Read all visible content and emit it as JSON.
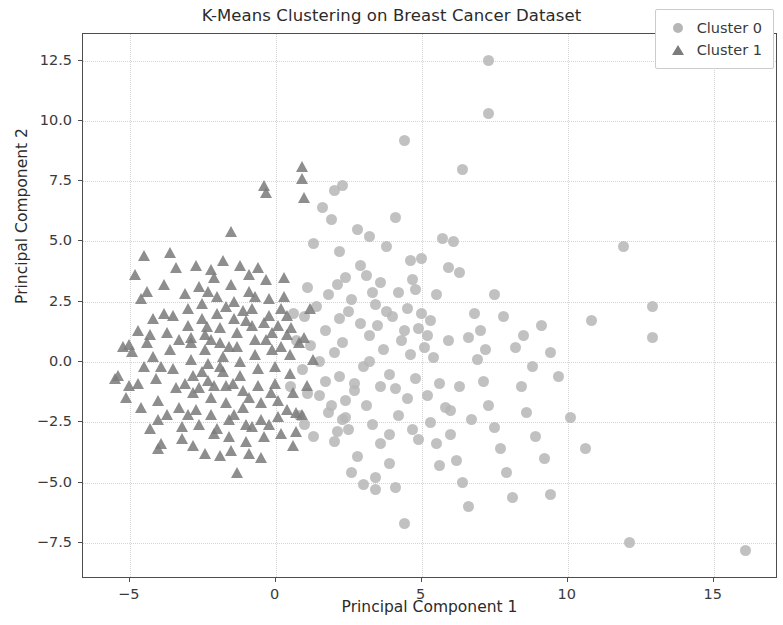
{
  "chart_data": {
    "type": "scatter",
    "title": "K-Means Clustering on Breast Cancer Dataset",
    "xlabel": "Principal Component 1",
    "ylabel": "Principal Component 2",
    "xlim": [
      -6.6,
      17.2
    ],
    "ylim": [
      -9.0,
      13.6
    ],
    "xticks": [
      -5,
      0,
      5,
      10,
      15
    ],
    "xticklabels": [
      "−5",
      "0",
      "5",
      "10",
      "15"
    ],
    "yticks": [
      -7.5,
      -5.0,
      -2.5,
      0.0,
      2.5,
      5.0,
      7.5,
      10.0,
      12.5
    ],
    "yticklabels": [
      "−7.5",
      "−5.0",
      "−2.5",
      "0.0",
      "2.5",
      "5.0",
      "7.5",
      "10.0",
      "12.5"
    ],
    "grid": true,
    "legend_position": "upper right",
    "series": [
      {
        "name": "Cluster 0",
        "marker": "circle",
        "color": "#b6b6b6",
        "points": [
          [
            1.3,
            4.9
          ],
          [
            1.6,
            6.4
          ],
          [
            1.9,
            5.9
          ],
          [
            2.2,
            4.6
          ],
          [
            2.4,
            3.5
          ],
          [
            2.5,
            2.1
          ],
          [
            1.4,
            2.3
          ],
          [
            1.7,
            1.3
          ],
          [
            2.0,
            0.4
          ],
          [
            2.2,
            -0.6
          ],
          [
            1.5,
            -1.4
          ],
          [
            1.8,
            -2.1
          ],
          [
            2.1,
            -2.9
          ],
          [
            2.4,
            -2.3
          ],
          [
            2.7,
            -1.2
          ],
          [
            3.0,
            -0.2
          ],
          [
            3.2,
            1.1
          ],
          [
            3.4,
            2.4
          ],
          [
            3.6,
            3.3
          ],
          [
            3.8,
            4.8
          ],
          [
            4.1,
            6.0
          ],
          [
            4.4,
            9.2
          ],
          [
            4.6,
            4.2
          ],
          [
            4.8,
            3.0
          ],
          [
            5.0,
            2.0
          ],
          [
            5.2,
            1.1
          ],
          [
            5.4,
            0.2
          ],
          [
            5.6,
            -0.9
          ],
          [
            5.8,
            -1.9
          ],
          [
            6.0,
            -3.0
          ],
          [
            6.2,
            -4.1
          ],
          [
            6.4,
            -5.0
          ],
          [
            6.6,
            -6.0
          ],
          [
            4.4,
            -6.7
          ],
          [
            4.1,
            -5.2
          ],
          [
            3.9,
            -4.2
          ],
          [
            3.6,
            -3.4
          ],
          [
            3.3,
            -2.6
          ],
          [
            3.1,
            -1.8
          ],
          [
            2.8,
            -3.9
          ],
          [
            2.6,
            -4.6
          ],
          [
            3.4,
            -4.8
          ],
          [
            3.9,
            -3.0
          ],
          [
            4.2,
            -2.2
          ],
          [
            4.5,
            -1.5
          ],
          [
            4.8,
            -0.7
          ],
          [
            5.1,
            0.6
          ],
          [
            5.3,
            1.7
          ],
          [
            5.5,
            2.8
          ],
          [
            5.9,
            3.9
          ],
          [
            6.1,
            5.0
          ],
          [
            6.4,
            8.0
          ],
          [
            7.3,
            12.5
          ],
          [
            7.3,
            10.3
          ],
          [
            6.6,
            1.0
          ],
          [
            6.9,
            0.1
          ],
          [
            7.1,
            -0.8
          ],
          [
            7.3,
            -1.8
          ],
          [
            7.5,
            -2.7
          ],
          [
            7.7,
            -3.6
          ],
          [
            7.9,
            -4.6
          ],
          [
            8.1,
            -5.6
          ],
          [
            7.5,
            2.8
          ],
          [
            7.8,
            1.9
          ],
          [
            8.2,
            0.6
          ],
          [
            8.4,
            -1.0
          ],
          [
            8.6,
            -2.1
          ],
          [
            8.9,
            -3.1
          ],
          [
            9.2,
            -4.0
          ],
          [
            9.4,
            -5.5
          ],
          [
            9.1,
            1.5
          ],
          [
            9.4,
            0.4
          ],
          [
            9.7,
            -0.6
          ],
          [
            10.1,
            -2.3
          ],
          [
            10.6,
            -3.6
          ],
          [
            10.8,
            1.7
          ],
          [
            11.9,
            4.8
          ],
          [
            12.1,
            -7.5
          ],
          [
            12.9,
            2.3
          ],
          [
            12.9,
            1.0
          ],
          [
            16.1,
            -7.8
          ],
          [
            1.1,
            3.1
          ],
          [
            1.0,
            1.9
          ],
          [
            1.2,
            0.7
          ],
          [
            0.9,
            -0.3
          ],
          [
            1.1,
            -1.3
          ],
          [
            0.8,
            -2.2
          ],
          [
            1.3,
            -3.1
          ],
          [
            2.0,
            7.1
          ],
          [
            2.3,
            7.3
          ],
          [
            2.9,
            4.0
          ],
          [
            3.1,
            3.6
          ],
          [
            3.3,
            2.9
          ],
          [
            3.5,
            1.5
          ],
          [
            3.7,
            0.5
          ],
          [
            3.9,
            -0.5
          ],
          [
            4.1,
            -1.1
          ],
          [
            4.3,
            0.9
          ],
          [
            4.5,
            2.2
          ],
          [
            4.7,
            3.4
          ],
          [
            2.6,
            2.6
          ],
          [
            2.9,
            1.6
          ],
          [
            3.2,
            0.0
          ],
          [
            2.7,
            -0.9
          ],
          [
            2.4,
            -1.6
          ],
          [
            2.2,
            1.8
          ],
          [
            1.8,
            2.8
          ],
          [
            2.1,
            3.2
          ],
          [
            5.7,
            5.1
          ],
          [
            6.3,
            3.7
          ],
          [
            6.8,
            2.0
          ],
          [
            5.0,
            4.3
          ],
          [
            4.9,
            -3.2
          ],
          [
            5.3,
            -2.5
          ],
          [
            5.6,
            -4.3
          ],
          [
            6.0,
            -2.0
          ],
          [
            6.3,
            -1.0
          ],
          [
            6.7,
            -2.4
          ],
          [
            7.0,
            1.3
          ],
          [
            7.2,
            0.5
          ],
          [
            3.0,
            -5.1
          ],
          [
            3.4,
            -5.3
          ],
          [
            2.8,
            5.5
          ],
          [
            3.2,
            5.2
          ],
          [
            1.5,
            0.0
          ],
          [
            1.7,
            -0.8
          ],
          [
            2.3,
            0.8
          ],
          [
            2.5,
            -2.8
          ],
          [
            4.0,
            1.9
          ],
          [
            4.2,
            2.9
          ],
          [
            4.4,
            1.3
          ],
          [
            4.6,
            0.3
          ],
          [
            4.9,
            1.4
          ],
          [
            5.2,
            -1.4
          ],
          [
            5.5,
            -3.4
          ],
          [
            2.0,
            -3.3
          ],
          [
            2.3,
            -2.4
          ],
          [
            1.9,
            -1.8
          ],
          [
            0.6,
            2.0
          ],
          [
            0.7,
            0.9
          ],
          [
            0.5,
            -1.0
          ],
          [
            1.0,
            -2.6
          ],
          [
            3.8,
            2.1
          ],
          [
            3.6,
            -1.0
          ],
          [
            4.7,
            -2.8
          ],
          [
            5.9,
            0.9
          ],
          [
            8.5,
            1.1
          ],
          [
            8.8,
            -0.2
          ]
        ]
      },
      {
        "name": "Cluster 1",
        "marker": "triangle",
        "color": "#7c7c7c",
        "points": [
          [
            -5.4,
            -0.6
          ],
          [
            -5.0,
            0.7
          ],
          [
            -4.9,
            0.4
          ],
          [
            -4.7,
            1.3
          ],
          [
            -4.6,
            2.6
          ],
          [
            -4.5,
            4.4
          ],
          [
            -4.3,
            1.1
          ],
          [
            -4.2,
            0.2
          ],
          [
            -4.1,
            -0.7
          ],
          [
            -4.0,
            -1.6
          ],
          [
            -4.0,
            -2.4
          ],
          [
            -3.9,
            -3.4
          ],
          [
            -3.8,
            2.0
          ],
          [
            -3.7,
            1.2
          ],
          [
            -3.6,
            0.5
          ],
          [
            -3.5,
            -0.3
          ],
          [
            -3.4,
            -1.1
          ],
          [
            -3.3,
            -1.9
          ],
          [
            -3.2,
            -2.7
          ],
          [
            -3.1,
            2.8
          ],
          [
            -3.0,
            2.2
          ],
          [
            -3.0,
            1.5
          ],
          [
            -2.9,
            0.8
          ],
          [
            -2.9,
            0.1
          ],
          [
            -2.8,
            -0.6
          ],
          [
            -2.8,
            -1.3
          ],
          [
            -2.7,
            -2.0
          ],
          [
            -2.6,
            -2.6
          ],
          [
            -2.6,
            3.1
          ],
          [
            -2.5,
            2.4
          ],
          [
            -2.5,
            1.8
          ],
          [
            -2.4,
            1.1
          ],
          [
            -2.4,
            0.5
          ],
          [
            -2.3,
            -0.1
          ],
          [
            -2.3,
            -0.8
          ],
          [
            -2.2,
            -1.5
          ],
          [
            -2.2,
            -2.2
          ],
          [
            -2.1,
            -3.0
          ],
          [
            -2.1,
            3.5
          ],
          [
            -2.0,
            2.7
          ],
          [
            -2.0,
            2.0
          ],
          [
            -1.9,
            1.4
          ],
          [
            -1.9,
            0.8
          ],
          [
            -1.8,
            0.2
          ],
          [
            -1.8,
            -0.4
          ],
          [
            -1.7,
            -1.0
          ],
          [
            -1.7,
            -1.7
          ],
          [
            -1.6,
            -2.4
          ],
          [
            -1.6,
            -3.1
          ],
          [
            -1.5,
            5.4
          ],
          [
            -1.5,
            3.2
          ],
          [
            -1.4,
            2.5
          ],
          [
            -1.4,
            1.8
          ],
          [
            -1.3,
            1.2
          ],
          [
            -1.3,
            0.6
          ],
          [
            -1.2,
            0.0
          ],
          [
            -1.2,
            -0.6
          ],
          [
            -1.1,
            -1.2
          ],
          [
            -1.1,
            -1.9
          ],
          [
            -1.0,
            -2.6
          ],
          [
            -1.0,
            -3.3
          ],
          [
            -0.9,
            3.6
          ],
          [
            -0.9,
            2.9
          ],
          [
            -0.8,
            2.2
          ],
          [
            -0.8,
            1.5
          ],
          [
            -0.7,
            0.9
          ],
          [
            -0.7,
            0.3
          ],
          [
            -0.6,
            -0.3
          ],
          [
            -0.6,
            -1.0
          ],
          [
            -0.5,
            -1.7
          ],
          [
            -0.5,
            -2.4
          ],
          [
            -0.4,
            -3.1
          ],
          [
            -0.4,
            7.3
          ],
          [
            -0.3,
            7.0
          ],
          [
            -0.3,
            3.4
          ],
          [
            -0.2,
            2.6
          ],
          [
            -0.2,
            1.9
          ],
          [
            -0.1,
            1.2
          ],
          [
            -0.1,
            0.5
          ],
          [
            0.0,
            -0.2
          ],
          [
            0.0,
            -0.9
          ],
          [
            0.1,
            -1.6
          ],
          [
            0.1,
            -2.3
          ],
          [
            0.2,
            -3.0
          ],
          [
            0.3,
            3.5
          ],
          [
            0.3,
            2.7
          ],
          [
            0.4,
            1.9
          ],
          [
            0.4,
            1.1
          ],
          [
            0.5,
            0.3
          ],
          [
            0.5,
            -0.5
          ],
          [
            0.6,
            -1.3
          ],
          [
            0.7,
            -2.1
          ],
          [
            0.7,
            -2.9
          ],
          [
            0.9,
            8.1
          ],
          [
            0.9,
            7.6
          ],
          [
            1.0,
            6.8
          ],
          [
            -1.3,
            -4.6
          ],
          [
            -4.0,
            -3.6
          ],
          [
            -5.5,
            -0.7
          ],
          [
            -5.2,
            0.6
          ],
          [
            -4.8,
            3.6
          ],
          [
            -3.4,
            3.9
          ],
          [
            -2.7,
            4.0
          ],
          [
            -1.8,
            4.2
          ],
          [
            -1.2,
            4.0
          ],
          [
            -0.6,
            3.9
          ],
          [
            -3.6,
            4.5
          ],
          [
            -2.2,
            3.8
          ],
          [
            -4.4,
            2.9
          ],
          [
            -3.8,
            3.2
          ],
          [
            -2.8,
            -3.5
          ],
          [
            -2.4,
            -3.8
          ],
          [
            -1.9,
            -3.9
          ],
          [
            -1.5,
            -3.7
          ],
          [
            -0.9,
            -3.8
          ],
          [
            -0.5,
            -4.0
          ],
          [
            -3.2,
            -3.2
          ],
          [
            -4.3,
            -2.8
          ],
          [
            -4.6,
            -1.9
          ],
          [
            -4.7,
            -0.9
          ],
          [
            -5.1,
            -1.5
          ],
          [
            -3.5,
            1.9
          ],
          [
            -3.1,
            -0.9
          ],
          [
            -2.9,
            1.0
          ],
          [
            -2.6,
            -1.1
          ],
          [
            -2.3,
            2.9
          ],
          [
            -2.0,
            -2.8
          ],
          [
            -1.7,
            2.3
          ],
          [
            -1.4,
            -2.2
          ],
          [
            -1.1,
            2.1
          ],
          [
            -0.8,
            -2.7
          ],
          [
            -0.2,
            -2.6
          ],
          [
            0.2,
            2.2
          ],
          [
            0.6,
            -3.5
          ],
          [
            0.8,
            0.8
          ],
          [
            1.0,
            1.0
          ],
          [
            1.1,
            -1.0
          ],
          [
            1.2,
            2.2
          ],
          [
            0.9,
            -2.2
          ],
          [
            1.3,
            0.1
          ],
          [
            -3.3,
            0.9
          ],
          [
            -2.5,
            -0.4
          ],
          [
            -1.6,
            0.6
          ],
          [
            -0.9,
            -1.5
          ],
          [
            -0.3,
            0.9
          ],
          [
            -4.2,
            1.8
          ],
          [
            -3.9,
            -0.2
          ],
          [
            -2.1,
            -1.0
          ],
          [
            -1.0,
            1.7
          ],
          [
            0.1,
            1.5
          ],
          [
            -4.5,
            -0.2
          ],
          [
            -3.7,
            -2.2
          ],
          [
            -2.2,
            0.9
          ],
          [
            -0.4,
            1.6
          ],
          [
            0.4,
            -2.0
          ],
          [
            -5.0,
            -1.0
          ],
          [
            -4.4,
            0.8
          ],
          [
            -3.0,
            -2.2
          ],
          [
            -1.9,
            -0.2
          ],
          [
            -0.7,
            2.7
          ],
          [
            0.2,
            0.6
          ],
          [
            -2.35,
            1.45
          ],
          [
            -1.45,
            -0.9
          ],
          [
            -0.15,
            -1.3
          ],
          [
            0.55,
            1.4
          ]
        ]
      }
    ]
  },
  "legend": {
    "items": [
      {
        "label": "Cluster 0",
        "marker": "circle-marker"
      },
      {
        "label": "Cluster 1",
        "marker": "triangle-marker"
      }
    ]
  }
}
